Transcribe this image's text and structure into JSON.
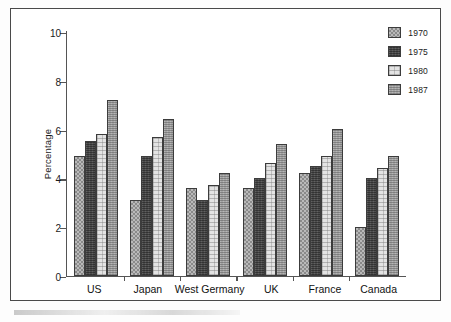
{
  "chart_data": {
    "type": "bar",
    "title": "",
    "xlabel": "",
    "ylabel": "Percentage",
    "ylim": [
      0,
      10
    ],
    "yticks": [
      0,
      2,
      4,
      6,
      8,
      10
    ],
    "ytick_labels": [
      "0",
      "2",
      "4",
      "6",
      "8",
      "10"
    ],
    "grid": false,
    "legend_position": "top-right",
    "categories": [
      "US",
      "Japan",
      "West Germany",
      "UK",
      "France",
      "Canada"
    ],
    "series": [
      {
        "name": "1970",
        "values": [
          4.9,
          3.1,
          3.6,
          3.6,
          4.2,
          2.0
        ],
        "swatch": "fill-1970"
      },
      {
        "name": "1975",
        "values": [
          5.5,
          4.9,
          3.1,
          4.0,
          4.5,
          4.0
        ],
        "swatch": "fill-1975"
      },
      {
        "name": "1980",
        "values": [
          5.8,
          5.7,
          3.7,
          4.6,
          4.9,
          4.4
        ],
        "swatch": "fill-1980"
      },
      {
        "name": "1987",
        "values": [
          7.2,
          6.4,
          4.2,
          5.4,
          6.0,
          4.9
        ],
        "swatch": "fill-1987"
      }
    ]
  },
  "legend": {
    "items": [
      {
        "label": "1970"
      },
      {
        "label": "1975"
      },
      {
        "label": "1980"
      },
      {
        "label": "1987"
      }
    ]
  }
}
